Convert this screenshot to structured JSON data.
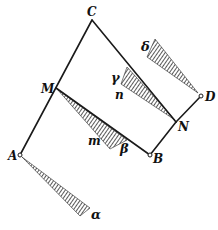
{
  "figure": {
    "points": [
      {
        "id": "C",
        "x": 92,
        "y": 20,
        "label": "C",
        "lx": 87,
        "ly": 16,
        "open": false
      },
      {
        "id": "M",
        "x": 56,
        "y": 88,
        "label": "M",
        "lx": 41,
        "ly": 93,
        "open": false
      },
      {
        "id": "A",
        "x": 20,
        "y": 155,
        "label": "A",
        "lx": 8,
        "ly": 160,
        "open": true
      },
      {
        "id": "B",
        "x": 150,
        "y": 155,
        "label": "B",
        "lx": 153,
        "ly": 163,
        "open": true
      },
      {
        "id": "N",
        "x": 176,
        "y": 122,
        "label": "N",
        "lx": 178,
        "ly": 131,
        "open": false
      },
      {
        "id": "D",
        "x": 201,
        "y": 96,
        "label": "D",
        "lx": 205,
        "ly": 101,
        "open": true
      }
    ],
    "edges": [
      [
        "A",
        "C"
      ],
      [
        "C",
        "N"
      ],
      [
        "N",
        "B"
      ],
      [
        "M",
        "B"
      ],
      [
        "N",
        "D"
      ]
    ],
    "hatched_sectors": [
      {
        "id": "alpha",
        "apex": [
          22,
          157
        ],
        "p1": [
          90,
          208
        ],
        "p2": [
          80,
          216
        ],
        "label": "α",
        "lx": 91,
        "ly": 219
      },
      {
        "id": "beta",
        "apex": [
          57,
          89
        ],
        "p1": [
          127,
          140
        ],
        "p2": [
          110,
          149
        ],
        "label": "β",
        "lx": 120,
        "ly": 153
      },
      {
        "id": "gamma",
        "apex": [
          175,
          120
        ],
        "p1": [
          127,
          67
        ],
        "p2": [
          121,
          84
        ],
        "label": "γ",
        "lx": 111,
        "ly": 82
      },
      {
        "id": "delta",
        "apex": [
          198,
          93
        ],
        "p1": [
          155,
          39
        ],
        "p2": [
          147,
          57
        ],
        "label": "δ",
        "lx": 141,
        "ly": 51
      }
    ],
    "extra_labels": [
      {
        "id": "m",
        "text": "m",
        "x": 88,
        "y": 145
      },
      {
        "id": "n",
        "text": "n",
        "x": 115,
        "y": 99
      }
    ]
  }
}
